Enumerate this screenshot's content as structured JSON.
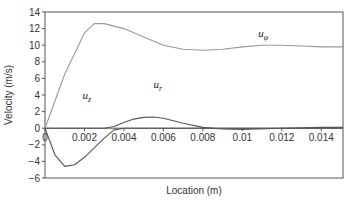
{
  "chart_data": {
    "type": "line",
    "title": "",
    "xlabel": "Location (m)",
    "ylabel": "Velocity (m/s)",
    "xlim": [
      0,
      0.0151
    ],
    "ylim": [
      -6,
      14
    ],
    "grid": false,
    "xticks": [
      "0",
      "0.002",
      "0.004",
      "0.006",
      "0.008",
      "0.01",
      "0.012",
      "0.014"
    ],
    "yticks": [
      "14",
      "12",
      "10",
      "8",
      "6",
      "4",
      "2",
      "0",
      "-2",
      "-4",
      "-6"
    ],
    "series": [
      {
        "name": "u_phi",
        "label": "u",
        "subscript": "φ",
        "x": [
          0,
          0.001,
          0.002,
          0.0025,
          0.003,
          0.004,
          0.005,
          0.006,
          0.007,
          0.008,
          0.009,
          0.01,
          0.011,
          0.012,
          0.013,
          0.014,
          0.0151
        ],
        "y": [
          0,
          6.5,
          11.5,
          12.6,
          12.6,
          12.0,
          11.0,
          10.0,
          9.5,
          9.4,
          9.5,
          9.8,
          10.0,
          10.0,
          9.9,
          9.8,
          9.8
        ]
      },
      {
        "name": "u_z",
        "label": "u",
        "subscript": "z",
        "x": [
          0,
          0.0005,
          0.001,
          0.0015,
          0.002,
          0.003,
          0.0035,
          0.004,
          0.005,
          0.006,
          0.007,
          0.0151
        ],
        "y": [
          0,
          -3.2,
          -4.6,
          -4.4,
          -3.5,
          -1.2,
          -0.2,
          0,
          0,
          0,
          0,
          0
        ]
      },
      {
        "name": "u_r",
        "label": "u",
        "subscript": "r",
        "x": [
          0,
          0.003,
          0.0035,
          0.004,
          0.0045,
          0.005,
          0.0055,
          0.006,
          0.007,
          0.008,
          0.009,
          0.01,
          0.012,
          0.014,
          0.0151
        ],
        "y": [
          0,
          0,
          0.2,
          0.7,
          1.1,
          1.3,
          1.35,
          1.2,
          0.6,
          0.1,
          -0.1,
          -0.15,
          0,
          0.1,
          0.1
        ]
      }
    ],
    "annotations": [
      {
        "text": "u_phi",
        "x": 0.0108,
        "y": 11.0
      },
      {
        "text": "u_z",
        "x": 0.0019,
        "y": 3.5
      },
      {
        "text": "u_r",
        "x": 0.0055,
        "y": 4.8
      }
    ]
  }
}
